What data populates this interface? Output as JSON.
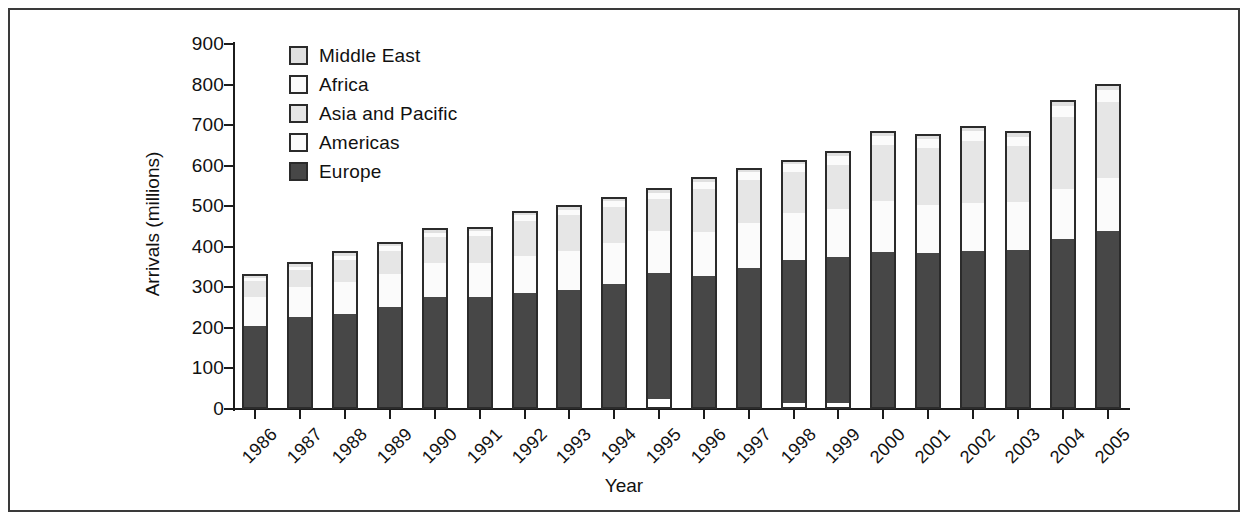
{
  "chart_data": {
    "type": "bar",
    "stacked": true,
    "title": "",
    "subtitle": "",
    "xlabel": "Year",
    "ylabel": "Arrivals (millions)",
    "ylim": [
      0,
      900
    ],
    "ytick_step": 100,
    "yticks": [
      0,
      100,
      200,
      300,
      400,
      500,
      600,
      700,
      800,
      900
    ],
    "grid": false,
    "legend_position": "top-left",
    "categories": [
      "1986",
      "1987",
      "1988",
      "1989",
      "1990",
      "1991",
      "1992",
      "1993",
      "1994",
      "1995",
      "1996",
      "1997",
      "1998",
      "1999",
      "2000",
      "2001",
      "2002",
      "2003",
      "2004",
      "2005"
    ],
    "series": [
      {
        "name": "Europe",
        "color": "#474747",
        "values": [
          207,
          228,
          236,
          252,
          277,
          277,
          288,
          295,
          310,
          317,
          330,
          349,
          360,
          367,
          389,
          387,
          394,
          396,
          420,
          440
        ]
      },
      {
        "name": "Americas",
        "color": "#fbfbfb",
        "values": [
          73,
          76,
          80,
          84,
          88,
          88,
          93,
          98,
          103,
          106,
          110,
          113,
          118,
          121,
          127,
          120,
          120,
          120,
          126,
          132
        ]
      },
      {
        "name": "Asia and Pacific",
        "color": "#e6e6e6",
        "values": [
          40,
          43,
          57,
          60,
          64,
          67,
          88,
          90,
          91,
          80,
          108,
          109,
          101,
          110,
          140,
          141,
          158,
          141,
          179,
          190
        ]
      },
      {
        "name": "Africa",
        "color": "#fbfbfb",
        "values": [
          9,
          10,
          11,
          11,
          12,
          13,
          14,
          14,
          15,
          16,
          17,
          18,
          20,
          21,
          22,
          23,
          24,
          23,
          28,
          30
        ]
      },
      {
        "name": "Middle East",
        "color": "#e0e0e0",
        "values": [
          5,
          6,
          6,
          6,
          6,
          6,
          6,
          6,
          6,
          6,
          7,
          7,
          7,
          8,
          8,
          8,
          9,
          9,
          10,
          10
        ]
      }
    ],
    "totals": [
      333,
      362,
      389,
      412,
      446,
      450,
      488,
      502,
      524,
      544,
      571,
      595,
      615,
      636,
      685,
      678,
      699,
      685,
      762,
      801
    ],
    "legend_entries": [
      {
        "label": "Middle East",
        "color": "#e0e0e0"
      },
      {
        "label": "Africa",
        "color": "#fbfbfb"
      },
      {
        "label": "Asia and Pacific",
        "color": "#e6e6e6"
      },
      {
        "label": "Americas",
        "color": "#fbfbfb"
      },
      {
        "label": "Europe",
        "color": "#474747"
      }
    ]
  },
  "colors": {
    "frame": "#3a3a3a",
    "axis": "#1c1c1c",
    "text": "#111111",
    "bar_outline": "#2b2b2b",
    "background": "#ffffff"
  }
}
